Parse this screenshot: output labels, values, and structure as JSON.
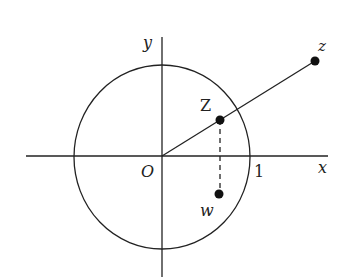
{
  "diagram": {
    "title": "",
    "colors": {
      "stroke": "#222222",
      "background": "#ffffff"
    },
    "axes": {
      "x_label": "x",
      "y_label": "y",
      "origin_label": "O",
      "unit_label": "1"
    },
    "points": [
      {
        "id": "z",
        "label": "z"
      },
      {
        "id": "Z",
        "label": "Z"
      },
      {
        "id": "w",
        "label": "w"
      }
    ],
    "circle": {
      "label": "unit circle",
      "radius": 1
    },
    "segments": [
      {
        "from": "O",
        "to": "z",
        "style": "solid"
      },
      {
        "from": "Z",
        "to": "w",
        "style": "dashed"
      }
    ]
  }
}
